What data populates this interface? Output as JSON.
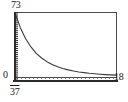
{
  "chart_data": {
    "type": "line",
    "title": "",
    "subtitle": "",
    "xlabel": "",
    "ylabel": "",
    "xlim": [
      37,
      18
    ],
    "ylim": [
      0,
      73
    ],
    "grid": false,
    "legend": null,
    "axis_labels": {
      "y_max": "73",
      "y_origin": "0",
      "x_min": "37",
      "x_max": "18"
    },
    "series": [
      {
        "name": "decay",
        "color": "#3a3a3a",
        "x": [
          37.0,
          36.0,
          35.0,
          34.0,
          33.0,
          32.0,
          31.0,
          30.0,
          29.0,
          28.0,
          27.0,
          26.0,
          25.0,
          24.0,
          23.0,
          22.0,
          21.0,
          20.0,
          19.0,
          18.0
        ],
        "values": [
          73.0,
          57.0,
          45.0,
          36.0,
          29.0,
          24.0,
          20.0,
          17.0,
          14.5,
          12.5,
          11.0,
          9.8,
          8.8,
          8.0,
          7.3,
          6.8,
          6.3,
          5.9,
          5.6,
          5.3
        ]
      }
    ],
    "reference_line": {
      "name": "baseline-dotted",
      "y": 2.0,
      "style": "dotted",
      "color": "#555555"
    },
    "y_axis_ticks": {
      "count": 34,
      "style": "dense-minor",
      "color": "#2b2b2b"
    }
  }
}
